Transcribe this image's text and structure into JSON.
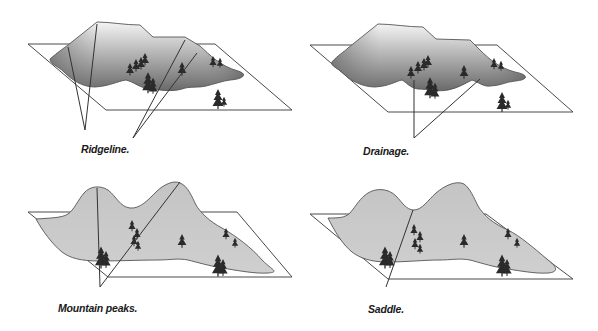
{
  "panels": [
    {
      "id": "ridgeline",
      "caption": "Ridgeline.",
      "terrain_feature": "ridgeline",
      "fill_style": "dark-gradient"
    },
    {
      "id": "drainage",
      "caption": "Drainage.",
      "terrain_feature": "drainage",
      "fill_style": "dark-gradient"
    },
    {
      "id": "mountain-peaks",
      "caption": "Mountain peaks.",
      "terrain_feature": "peaks",
      "fill_style": "light-gray"
    },
    {
      "id": "saddle",
      "caption": "Saddle.",
      "terrain_feature": "saddle",
      "fill_style": "light-gray"
    }
  ],
  "colors": {
    "background": "#ffffff",
    "frame_line": "#4a4a4a",
    "gradient_dark": "#6a6a6a",
    "gradient_light": "#e8e8e8",
    "light_fill": "#c8c8c8",
    "tree": "#2a2a2a",
    "text": "#1a1a1a"
  },
  "icons": {
    "tree": "pine-tree-icon"
  }
}
